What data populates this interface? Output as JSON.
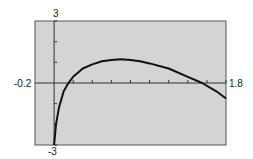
{
  "chart_data": {
    "type": "line",
    "title": "",
    "xlabel": "",
    "ylabel": "",
    "xlim": [
      -0.2,
      1.8
    ],
    "ylim": [
      -3,
      3
    ],
    "x_tick_step": 0.2,
    "y_tick_step": 1,
    "grid": false,
    "labels": {
      "xmin": "-0.2",
      "xmax": "1.8",
      "ymax": "3",
      "ymin": "-3"
    },
    "series": [
      {
        "name": "f(x)",
        "x": [
          0.0,
          0.02,
          0.05,
          0.1,
          0.15,
          0.2,
          0.3,
          0.4,
          0.5,
          0.6,
          0.7,
          0.8,
          0.9,
          1.0,
          1.2,
          1.4,
          1.55,
          1.7,
          1.8
        ],
        "values": [
          -3,
          -2.0,
          -1.2,
          -0.4,
          0,
          0.3,
          0.7,
          0.9,
          1.05,
          1.12,
          1.15,
          1.12,
          1.05,
          0.95,
          0.7,
          0.3,
          0,
          -0.4,
          -0.75
        ]
      }
    ]
  },
  "colors": {
    "plot_background": "#d4d4d4",
    "frame": "#555555",
    "axis": "#333333",
    "curve": "#111111"
  }
}
